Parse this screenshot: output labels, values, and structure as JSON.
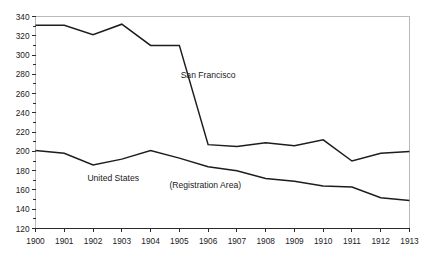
{
  "chart_data": {
    "type": "line",
    "title": "",
    "xlabel": "",
    "ylabel": "",
    "x": [
      1900,
      1901,
      1902,
      1903,
      1904,
      1905,
      1906,
      1907,
      1908,
      1909,
      1910,
      1911,
      1912,
      1913
    ],
    "categories": [
      "1900",
      "1901",
      "1902",
      "1903",
      "1904",
      "1905",
      "1906",
      "1907",
      "1908",
      "1909",
      "1910",
      "1911",
      "1912",
      "1913"
    ],
    "xlim": [
      1900,
      1913
    ],
    "ylim": [
      120,
      340
    ],
    "y_ticks": [
      120,
      140,
      160,
      180,
      200,
      220,
      240,
      260,
      280,
      300,
      320,
      340
    ],
    "y_tick_labels": [
      "120",
      "140",
      "160",
      "180",
      "200",
      "220",
      "240",
      "260",
      "280",
      "300",
      "320",
      "340"
    ],
    "y_minor_tick_step": 10,
    "grid": false,
    "legend": "none",
    "series": [
      {
        "name": "San Francisco",
        "color": "#1d1d1d",
        "values": [
          331,
          331,
          321,
          332,
          310,
          310,
          207,
          205,
          209,
          206,
          212,
          190,
          198,
          200
        ]
      },
      {
        "name": "United States",
        "color": "#1d1d1d",
        "values": [
          201,
          198,
          186,
          192,
          201,
          193,
          184,
          180,
          172,
          169,
          164,
          163,
          152,
          149
        ]
      }
    ],
    "annotations": [
      {
        "text": "San Francisco",
        "x": 1906.0,
        "y": 276
      },
      {
        "text": "United States",
        "x": 1902.7,
        "y": 169
      },
      {
        "text": "(Registration Area)",
        "x": 1905.9,
        "y": 162
      }
    ]
  }
}
